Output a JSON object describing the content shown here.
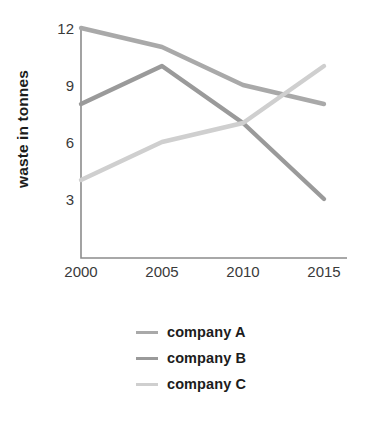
{
  "chart_data": {
    "type": "line",
    "title": "",
    "xlabel": "",
    "ylabel": "waste in tonnes",
    "categories": [
      "2000",
      "2005",
      "2010",
      "2015"
    ],
    "x": [
      2000,
      2005,
      2010,
      2015
    ],
    "xlim": [
      2000,
      2015
    ],
    "ylim": [
      0,
      12
    ],
    "yticks": [
      "3",
      "6",
      "9",
      "12"
    ],
    "ytick_values": [
      3,
      6,
      9,
      12
    ],
    "grid": false,
    "legend_position": "bottom",
    "series": [
      {
        "name": "company A",
        "values": [
          12,
          11,
          9,
          8
        ],
        "color": "#a9a9a9"
      },
      {
        "name": "company B",
        "values": [
          8,
          10,
          7,
          3
        ],
        "color": "#9a9a9a"
      },
      {
        "name": "company C",
        "values": [
          4,
          6,
          7,
          10
        ],
        "color": "#cfcfcf"
      }
    ],
    "axis_color": "#8c8c8c",
    "tick_label_color": "#3a3a3a",
    "legend_text_color": "#1c1c1c"
  },
  "legend": {
    "items": [
      {
        "label": "company A"
      },
      {
        "label": "company B"
      },
      {
        "label": "company C"
      }
    ]
  }
}
